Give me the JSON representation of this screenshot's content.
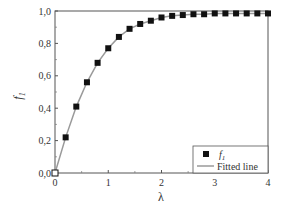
{
  "chart_data": {
    "type": "scatter",
    "title": "",
    "xlabel": "λ",
    "ylabel": "f1",
    "xlim": [
      0,
      4
    ],
    "ylim": [
      0,
      1.0
    ],
    "xticks": [
      "0",
      "1",
      "2",
      "3",
      "4"
    ],
    "yticks": [
      "0,0",
      "0,2",
      "0,4",
      "0,6",
      "0,8",
      "1,0"
    ],
    "grid": false,
    "legend_position": "lower right",
    "series": [
      {
        "name": "f1",
        "kind": "markers",
        "marker": "square",
        "color": "#111111",
        "x": [
          0,
          0.2,
          0.4,
          0.6,
          0.8,
          1.0,
          1.2,
          1.4,
          1.6,
          1.8,
          2.0,
          2.2,
          2.4,
          2.6,
          2.8,
          3.0,
          3.2,
          3.4,
          3.6,
          3.8,
          4.0
        ],
        "values": [
          0.0,
          0.22,
          0.41,
          0.56,
          0.68,
          0.77,
          0.84,
          0.89,
          0.92,
          0.94,
          0.96,
          0.97,
          0.975,
          0.98,
          0.98,
          0.985,
          0.985,
          0.985,
          0.985,
          0.985,
          0.985
        ]
      },
      {
        "name": "Fitted line",
        "kind": "line",
        "color": "#999999",
        "x": [
          0,
          0.2,
          0.4,
          0.6,
          0.8,
          1.0,
          1.2,
          1.4,
          1.6,
          1.8,
          2.0,
          2.2,
          2.4,
          2.6,
          2.8,
          3.0,
          3.2,
          3.4,
          3.6,
          3.8,
          4.0
        ],
        "values": [
          0.0,
          0.22,
          0.41,
          0.56,
          0.68,
          0.77,
          0.84,
          0.89,
          0.92,
          0.94,
          0.96,
          0.97,
          0.975,
          0.98,
          0.98,
          0.985,
          0.985,
          0.985,
          0.985,
          0.985,
          0.985
        ]
      }
    ]
  },
  "legend": {
    "items": [
      {
        "label": "f",
        "sub": "1"
      },
      {
        "label": "Fitted line"
      }
    ]
  },
  "axes": {
    "xlabel": "λ",
    "ylabel": "f",
    "ylabel_sub": "1"
  }
}
